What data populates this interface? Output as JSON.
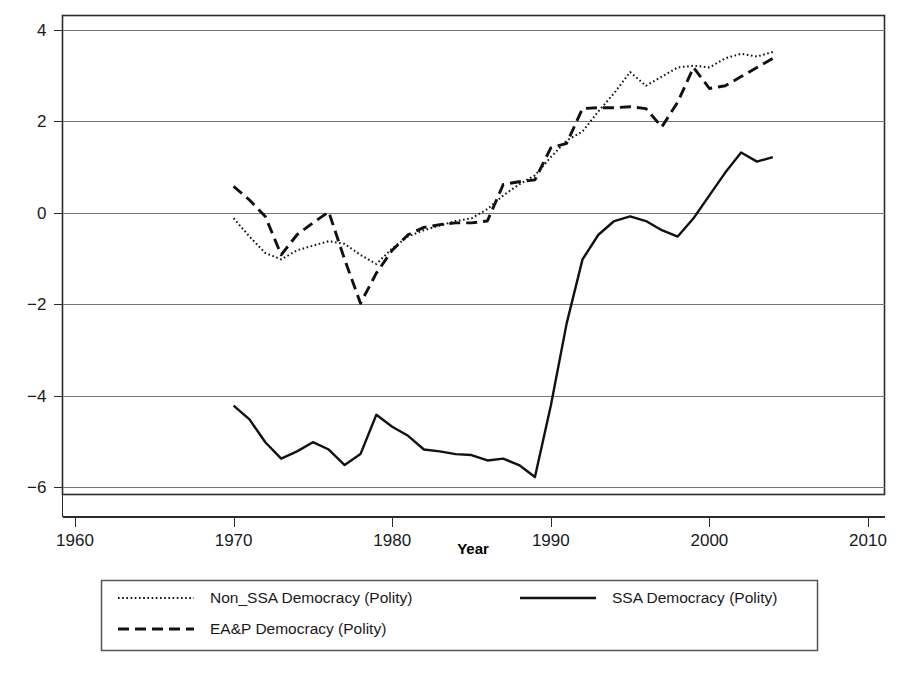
{
  "chart_data": {
    "type": "line",
    "title": "",
    "xlabel": "Year",
    "ylabel": "",
    "xlim": [
      1960,
      2010
    ],
    "ylim": [
      -6.4,
      4.4
    ],
    "xticks": [
      1960,
      1970,
      1980,
      1990,
      2000,
      2010
    ],
    "yticks": [
      4,
      2,
      0,
      -2,
      -4,
      -6
    ],
    "xtick_labels": [
      "1960",
      "1970",
      "1980",
      "1990",
      "2000",
      "2010"
    ],
    "ytick_labels": [
      "4",
      "2",
      "0",
      "-2",
      "-4",
      "-6"
    ],
    "grid": true,
    "legend_position": "below-plot",
    "series": [
      {
        "name": "Non_SSA Democracy (Polity)",
        "style": "dotted",
        "color": "#111111",
        "x": [
          1970,
          1971,
          1972,
          1973,
          1974,
          1975,
          1976,
          1977,
          1978,
          1979,
          1980,
          1981,
          1982,
          1983,
          1984,
          1985,
          1986,
          1987,
          1988,
          1989,
          1990,
          1991,
          1992,
          1993,
          1994,
          1995,
          1996,
          1997,
          1998,
          1999,
          2000,
          2001,
          2002,
          2003,
          2004
        ],
        "values": [
          -0.12,
          -0.52,
          -0.88,
          -1.02,
          -0.82,
          -0.72,
          -0.62,
          -0.68,
          -0.92,
          -1.12,
          -0.78,
          -0.52,
          -0.38,
          -0.28,
          -0.18,
          -0.12,
          0.08,
          0.38,
          0.62,
          0.82,
          1.22,
          1.58,
          1.78,
          2.22,
          2.62,
          3.08,
          2.78,
          2.98,
          3.18,
          3.22,
          3.18,
          3.38,
          3.48,
          3.42,
          3.52
        ],
        "values_tail": [
          3.62,
          3.68,
          3.72,
          3.78,
          3.88,
          3.95,
          4.12
        ]
      },
      {
        "name": "EA&P Democracy (Polity)",
        "style": "dashed",
        "color": "#111111",
        "x": [
          1970,
          1971,
          1972,
          1973,
          1974,
          1975,
          1976,
          1977,
          1978,
          1979,
          1980,
          1981,
          1982,
          1983,
          1984,
          1985,
          1986,
          1987,
          1988,
          1989,
          1990,
          1991,
          1992,
          1993,
          1994,
          1995,
          1996,
          1997,
          1998,
          1999,
          2000,
          2001,
          2002,
          2003,
          2004
        ],
        "values": [
          0.58,
          0.28,
          -0.08,
          -0.92,
          -0.48,
          -0.22,
          0.02,
          -1.02,
          -1.98,
          -1.32,
          -0.82,
          -0.48,
          -0.32,
          -0.26,
          -0.22,
          -0.22,
          -0.18,
          0.62,
          0.68,
          0.72,
          1.42,
          1.52,
          2.28,
          2.3,
          2.3,
          2.32,
          2.28,
          1.88,
          2.42,
          3.18,
          2.72,
          2.78,
          2.98,
          3.18,
          3.38
        ]
      },
      {
        "name": "SSA Democracy (Polity)",
        "style": "solid",
        "color": "#111111",
        "x": [
          1970,
          1971,
          1972,
          1973,
          1974,
          1975,
          1976,
          1977,
          1978,
          1979,
          1980,
          1981,
          1982,
          1983,
          1984,
          1985,
          1986,
          1987,
          1988,
          1989,
          1990,
          1991,
          1992,
          1993,
          1994,
          1995,
          1996,
          1997,
          1998,
          1999,
          2000,
          2001,
          2002,
          2003,
          2004
        ],
        "values": [
          -4.22,
          -4.52,
          -5.02,
          -5.38,
          -5.22,
          -5.02,
          -5.18,
          -5.52,
          -5.28,
          -4.42,
          -4.68,
          -4.88,
          -5.18,
          -5.22,
          -5.28,
          -5.3,
          -5.42,
          -5.38,
          -5.52,
          -5.78,
          -4.22,
          -2.42,
          -1.02,
          -0.48,
          -0.18,
          -0.08,
          -0.18,
          -0.38,
          -0.52,
          -0.12,
          0.38,
          0.88,
          1.32,
          1.12,
          1.22
        ]
      }
    ]
  },
  "legend": {
    "entries": [
      {
        "label": "Non_SSA Democracy (Polity)",
        "style": "dotted"
      },
      {
        "label": "SSA Democracy (Polity)",
        "style": "solid"
      },
      {
        "label": "EA&P Democracy (Polity)",
        "style": "dashed"
      }
    ]
  },
  "colors": {
    "ink": "#111111",
    "grid": "#757575",
    "frame": "#2b2b2b",
    "background": "#ffffff"
  }
}
